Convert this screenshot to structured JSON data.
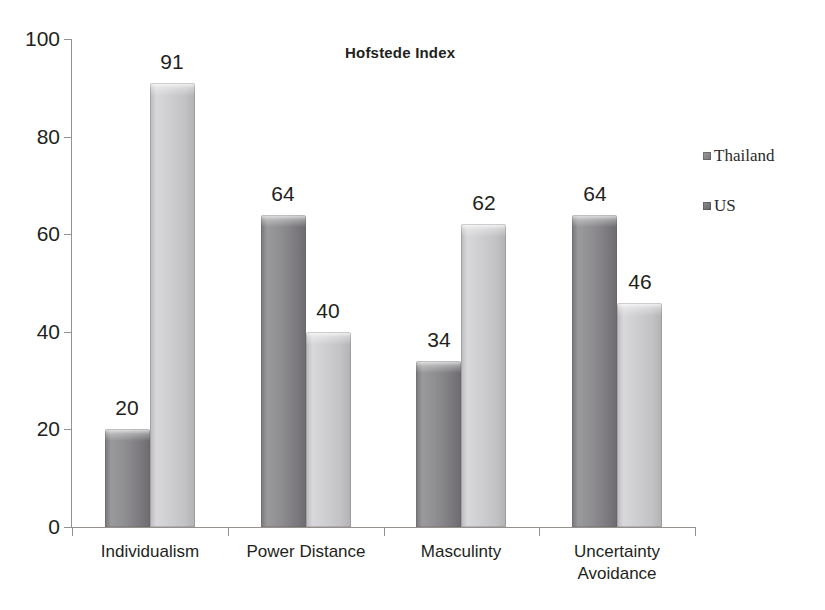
{
  "chart_data": {
    "type": "bar",
    "title": "Hofstede Index",
    "xlabel": "",
    "ylabel": "",
    "ylim": [
      0,
      100
    ],
    "ytick_values": [
      0,
      20,
      40,
      60,
      80,
      100
    ],
    "ytick_labels": [
      "0",
      "20",
      "40",
      "60",
      "80",
      "100"
    ],
    "grid": false,
    "legend_position": "right",
    "categories": [
      "Individualism",
      "Power Distance",
      "Masculinty",
      "Uncertainty Avoidance"
    ],
    "category_lines": [
      [
        "Individualism"
      ],
      [
        "Power Distance"
      ],
      [
        "Masculinty"
      ],
      [
        "Uncertainty",
        "Avoidance"
      ]
    ],
    "series": [
      {
        "name": "Thailand",
        "color": "#8e8d90",
        "values": [
          20,
          64,
          34,
          64
        ],
        "value_labels": [
          "20",
          "64",
          "34",
          "64"
        ]
      },
      {
        "name": "US",
        "color": "#cecdd0",
        "values": [
          91,
          40,
          62,
          46
        ],
        "value_labels": [
          "91",
          "40",
          "62",
          "46"
        ]
      }
    ]
  },
  "legend": {
    "items": [
      {
        "label": "Thailand",
        "swatch": "legend-swatch-thailand"
      },
      {
        "label": "US",
        "swatch": "legend-swatch-us"
      }
    ]
  },
  "axes": {
    "axis_color": "#96918c"
  }
}
